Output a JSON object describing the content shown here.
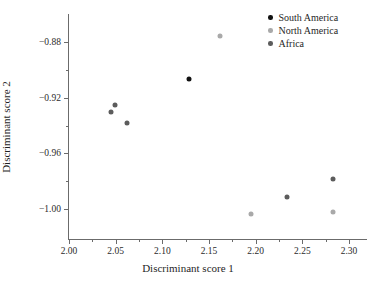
{
  "chart_data": {
    "type": "scatter",
    "title": "",
    "xlabel": "Discriminant score 1",
    "ylabel": "Discriminant score 2",
    "xlim": [
      2.0,
      2.3
    ],
    "ylim": [
      -1.005,
      -0.873
    ],
    "xticks": [
      "2.00",
      "2.05",
      "2.10",
      "2.15",
      "2.20",
      "2.25",
      "2.30"
    ],
    "xtick_values": [
      2.0,
      2.05,
      2.1,
      2.15,
      2.2,
      2.25,
      2.3
    ],
    "xminor_values": [
      2.025,
      2.075,
      2.125,
      2.175,
      2.225,
      2.275
    ],
    "yticks": [
      "−0.88",
      "−0.92",
      "−0.96",
      "−1.00"
    ],
    "ytick_values": [
      -0.88,
      -0.92,
      -0.96,
      -1.0
    ],
    "yminor_values": [
      -0.9,
      -0.94,
      -0.98
    ],
    "grid": false,
    "legend_position": "top-right",
    "series": [
      {
        "name": "South America",
        "color": "#111111",
        "points": [
          {
            "x": 2.129,
            "y": -0.9065
          }
        ]
      },
      {
        "name": "North America",
        "color": "#a9a9a9",
        "points": [
          {
            "x": 2.162,
            "y": -0.8755
          },
          {
            "x": 2.195,
            "y": -1.0035
          },
          {
            "x": 2.283,
            "y": -1.0025
          }
        ]
      },
      {
        "name": "Africa",
        "color": "#5c5c5c",
        "points": [
          {
            "x": 2.045,
            "y": -0.93
          },
          {
            "x": 2.049,
            "y": -0.925
          },
          {
            "x": 2.062,
            "y": -0.9385
          },
          {
            "x": 2.234,
            "y": -0.9915
          },
          {
            "x": 2.283,
            "y": -0.9785
          }
        ]
      }
    ]
  },
  "axis": {
    "line_color": "#6b6b6b",
    "text_color": "#2b2b2b"
  }
}
